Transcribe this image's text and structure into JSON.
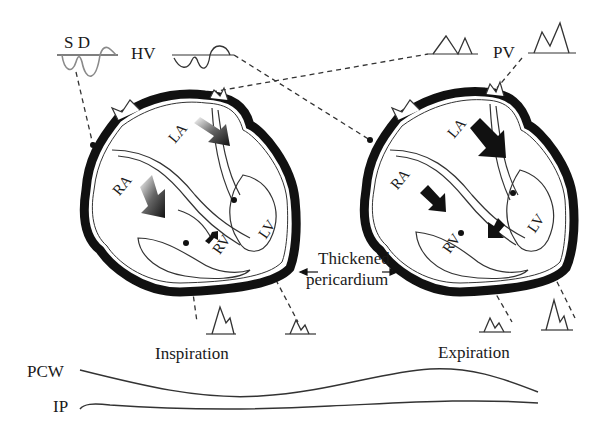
{
  "diagram": {
    "waveform_labels": {
      "sd": "S D",
      "hv": "HV",
      "pv": "PV"
    },
    "left_heart": {
      "phase": "Inspiration",
      "chambers": {
        "ra": "RA",
        "la": "LA",
        "rv": "RV",
        "lv": "LV"
      }
    },
    "right_heart": {
      "phase": "Expiration",
      "chambers": {
        "ra": "RA",
        "la": "LA",
        "rv": "RV",
        "lv": "LV"
      }
    },
    "pericardium_label": {
      "line1": "Thickened",
      "line2": "pericardium"
    },
    "pressure_traces": {
      "pcw": "PCW",
      "ip": "IP"
    },
    "colors": {
      "ink": "#1a1a1a",
      "gray_wave": "#8a8a8a",
      "background": "#ffffff"
    }
  }
}
